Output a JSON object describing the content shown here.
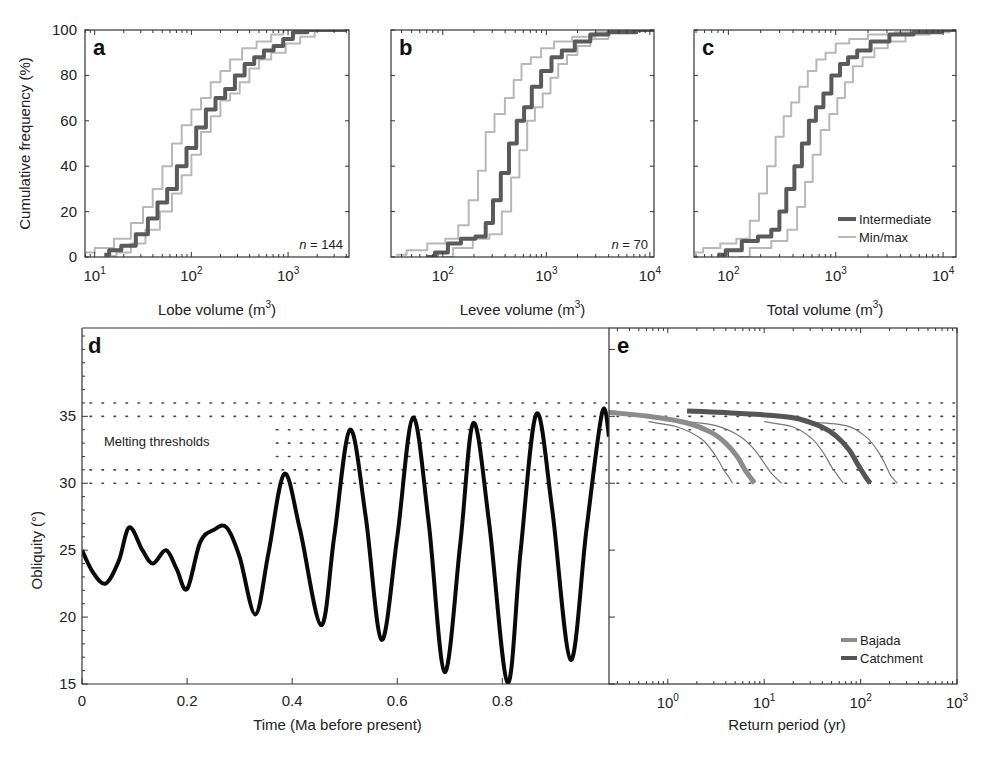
{
  "figure": {
    "panels": [
      "a",
      "b",
      "c",
      "d",
      "e"
    ]
  },
  "chart_data": [
    {
      "id": "a",
      "type": "line",
      "panel_label": "a",
      "xlabel": "Lobe volume (m3)",
      "xlabel_main": "Lobe volume (m",
      "xlabel_sup": "3",
      "xlabel_end": ")",
      "ylabel": "Cumulative frequency (%)",
      "xscale": "log",
      "xlim_log10": [
        0.9,
        3.63
      ],
      "ylim": [
        0,
        100
      ],
      "xticks": [
        {
          "base": "10",
          "exp": "1",
          "log": 1
        },
        {
          "base": "10",
          "exp": "2",
          "log": 2
        },
        {
          "base": "10",
          "exp": "3",
          "log": 3
        }
      ],
      "yticks": [
        "0",
        "20",
        "40",
        "60",
        "80",
        "100"
      ],
      "annotation_n": "n",
      "annotation_value": "= 144",
      "series": [
        {
          "name": "Intermediate",
          "role": "intermediate",
          "log10_x": [
            1.1,
            1.2,
            1.35,
            1.5,
            1.6,
            1.7,
            1.8,
            1.9,
            2.0,
            2.1,
            2.2,
            2.3,
            2.4,
            2.5,
            2.6,
            2.7,
            2.8,
            2.9,
            3.0,
            3.1,
            3.3,
            3.6
          ],
          "y": [
            1,
            3,
            5,
            10,
            17,
            24,
            30,
            40,
            48,
            57,
            65,
            70,
            74,
            80,
            85,
            88,
            91,
            93,
            96,
            99,
            100,
            100
          ]
        },
        {
          "name": "Min",
          "role": "minmax",
          "log10_x": [
            0.9,
            1.1,
            1.3,
            1.45,
            1.55,
            1.65,
            1.75,
            1.85,
            1.95,
            2.05,
            2.15,
            2.25,
            2.35,
            2.45,
            2.6,
            2.75,
            2.9,
            3.0,
            3.3,
            3.6
          ],
          "y": [
            2,
            4,
            8,
            15,
            22,
            30,
            40,
            50,
            58,
            65,
            70,
            77,
            82,
            87,
            92,
            95,
            98,
            100,
            100,
            100
          ]
        },
        {
          "name": "Max",
          "role": "minmax",
          "log10_x": [
            1.15,
            1.3,
            1.45,
            1.6,
            1.75,
            1.85,
            1.95,
            2.05,
            2.15,
            2.25,
            2.35,
            2.45,
            2.55,
            2.65,
            2.75,
            2.9,
            3.05,
            3.2,
            3.35,
            3.6
          ],
          "y": [
            0.5,
            2,
            6,
            12,
            20,
            28,
            36,
            45,
            55,
            62,
            69,
            72,
            77,
            83,
            87,
            90,
            94,
            97,
            100,
            100
          ]
        }
      ]
    },
    {
      "id": "b",
      "type": "line",
      "panel_label": "b",
      "xlabel": "Levee volume (m3)",
      "xlabel_main": "Levee volume (m",
      "xlabel_sup": "3",
      "xlabel_end": ")",
      "xscale": "log",
      "xlim_log10": [
        1.5,
        4.04
      ],
      "ylim": [
        0,
        100
      ],
      "xticks": [
        {
          "base": "10",
          "exp": "2",
          "log": 2
        },
        {
          "base": "10",
          "exp": "3",
          "log": 3
        },
        {
          "base": "10",
          "exp": "4",
          "log": 4
        }
      ],
      "annotation_n": "n",
      "annotation_value": "= 70",
      "series": [
        {
          "name": "Intermediate",
          "role": "intermediate",
          "log10_x": [
            1.85,
            2.0,
            2.1,
            2.25,
            2.38,
            2.45,
            2.52,
            2.6,
            2.68,
            2.75,
            2.82,
            2.9,
            3.0,
            3.1,
            3.2,
            3.35,
            3.5,
            3.7,
            4.04
          ],
          "y": [
            0,
            2,
            6,
            8,
            9,
            15,
            25,
            37,
            50,
            60,
            66,
            75,
            82,
            88,
            91,
            95,
            98,
            99,
            100
          ]
        },
        {
          "name": "Min",
          "role": "minmax",
          "log10_x": [
            1.55,
            1.75,
            1.95,
            2.1,
            2.2,
            2.3,
            2.38,
            2.45,
            2.55,
            2.65,
            2.72,
            2.8,
            2.9,
            3.0,
            3.15,
            3.35,
            3.6,
            4.04
          ],
          "y": [
            1,
            3,
            6,
            8,
            14,
            25,
            38,
            55,
            63,
            70,
            78,
            85,
            88,
            92,
            95,
            97,
            99,
            100
          ]
        },
        {
          "name": "Max",
          "role": "minmax",
          "log10_x": [
            2.0,
            2.2,
            2.38,
            2.52,
            2.62,
            2.7,
            2.78,
            2.85,
            2.93,
            3.0,
            3.08,
            3.15,
            3.25,
            3.35,
            3.5,
            3.7,
            4.04
          ],
          "y": [
            0,
            4,
            8,
            10,
            20,
            35,
            47,
            60,
            66,
            72,
            79,
            85,
            89,
            93,
            96,
            99,
            100
          ]
        }
      ]
    },
    {
      "id": "c",
      "type": "line",
      "panel_label": "c",
      "xlabel": "Total volume (m3)",
      "xlabel_main": "Total volume (m",
      "xlabel_sup": "3",
      "xlabel_end": ")",
      "xscale": "log",
      "xlim_log10": [
        1.68,
        4.12
      ],
      "ylim": [
        0,
        100
      ],
      "xticks": [
        {
          "base": "10",
          "exp": "2",
          "log": 2
        },
        {
          "base": "10",
          "exp": "3",
          "log": 3
        },
        {
          "base": "10",
          "exp": "4",
          "log": 4
        }
      ],
      "legend": [
        {
          "label": "Intermediate",
          "role": "intermediate"
        },
        {
          "label": "Min/max",
          "role": "minmax"
        }
      ],
      "series": [
        {
          "name": "Intermediate",
          "role": "intermediate",
          "log10_x": [
            1.9,
            2.05,
            2.2,
            2.35,
            2.45,
            2.5,
            2.58,
            2.65,
            2.72,
            2.78,
            2.85,
            2.92,
            3.0,
            3.08,
            3.15,
            3.25,
            3.4,
            3.6,
            3.85,
            4.12
          ],
          "y": [
            1,
            3,
            7,
            9,
            12,
            20,
            30,
            40,
            50,
            60,
            66,
            72,
            80,
            85,
            88,
            91,
            95,
            98,
            99,
            100
          ]
        },
        {
          "name": "Min",
          "role": "minmax",
          "log10_x": [
            1.68,
            1.85,
            2.0,
            2.15,
            2.25,
            2.32,
            2.4,
            2.48,
            2.55,
            2.62,
            2.7,
            2.78,
            2.86,
            2.95,
            3.05,
            3.2,
            3.4,
            3.7,
            4.12
          ],
          "y": [
            2,
            4,
            6,
            8,
            16,
            28,
            40,
            53,
            62,
            68,
            75,
            82,
            87,
            90,
            94,
            96,
            98,
            99,
            100
          ]
        },
        {
          "name": "Max",
          "role": "minmax",
          "log10_x": [
            2.1,
            2.3,
            2.5,
            2.6,
            2.68,
            2.75,
            2.82,
            2.9,
            2.98,
            3.05,
            3.12,
            3.2,
            3.3,
            3.42,
            3.55,
            3.75,
            4.0,
            4.12
          ],
          "y": [
            0,
            4,
            7,
            12,
            22,
            33,
            45,
            56,
            63,
            70,
            77,
            84,
            88,
            92,
            95,
            98,
            99,
            100
          ]
        }
      ]
    },
    {
      "id": "d",
      "type": "line",
      "panel_label": "d",
      "xlabel": "Time (Ma before present)",
      "ylabel": "Obliquity (°)",
      "xlim": [
        0,
        1.003
      ],
      "ylim": [
        15,
        41.6
      ],
      "xticks": [
        "0",
        "0.2",
        "0.4",
        "0.6",
        "0.8"
      ],
      "xtick_values": [
        0,
        0.2,
        0.4,
        0.6,
        0.8
      ],
      "yticks": [
        "15",
        "20",
        "25",
        "30",
        "35"
      ],
      "ytick_values": [
        15,
        20,
        25,
        30,
        35
      ],
      "melting_thresholds": [
        30,
        31,
        32,
        33,
        34,
        35,
        36
      ],
      "annotation": "Melting thresholds",
      "series": [
        {
          "name": "Obliquity",
          "x": [
            0.0,
            0.02,
            0.045,
            0.07,
            0.09,
            0.115,
            0.135,
            0.16,
            0.18,
            0.2,
            0.225,
            0.25,
            0.275,
            0.3,
            0.33,
            0.355,
            0.385,
            0.415,
            0.455,
            0.48,
            0.51,
            0.54,
            0.57,
            0.6,
            0.63,
            0.66,
            0.69,
            0.72,
            0.745,
            0.775,
            0.81,
            0.835,
            0.865,
            0.895,
            0.93,
            0.96,
            0.99,
            1.003
          ],
          "y": [
            25.0,
            23.4,
            22.5,
            24.2,
            26.7,
            25.0,
            24.0,
            25.0,
            23.6,
            22.1,
            25.6,
            26.5,
            26.7,
            24.5,
            20.2,
            24.8,
            30.7,
            26.5,
            19.4,
            26.0,
            34.0,
            27.5,
            18.3,
            26.0,
            34.9,
            27.0,
            15.9,
            25.5,
            34.5,
            27.0,
            15.1,
            25.0,
            35.2,
            28.0,
            16.8,
            26.5,
            35.3,
            33.5
          ]
        }
      ]
    },
    {
      "id": "e",
      "type": "line",
      "panel_label": "e",
      "xlabel": "Return period (yr)",
      "xscale": "log",
      "xlim_log10": [
        -0.61,
        3.0
      ],
      "ylim": [
        15,
        41.6
      ],
      "xticks": [
        {
          "base": "10",
          "exp": "0",
          "log": 0
        },
        {
          "base": "10",
          "exp": "1",
          "log": 1
        },
        {
          "base": "10",
          "exp": "2",
          "log": 2
        },
        {
          "base": "10",
          "exp": "3",
          "log": 3
        }
      ],
      "melting_thresholds": [
        30,
        31,
        32,
        33,
        34,
        35,
        36
      ],
      "legend": [
        {
          "label": "Bajada",
          "role": "bajada"
        },
        {
          "label": "Catchment",
          "role": "catchment"
        }
      ],
      "series": [
        {
          "name": "Bajada",
          "role": "bajada",
          "log10_x": [
            -0.61,
            -0.2,
            0.2,
            0.45,
            0.6,
            0.72,
            0.8,
            0.86,
            0.9
          ],
          "y": [
            35.3,
            35.0,
            34.5,
            33.8,
            33.0,
            32.0,
            31.0,
            30.4,
            30.0
          ]
        },
        {
          "name": "Bajada min",
          "role": "thin",
          "log10_x": [
            -0.2,
            0.1,
            0.35,
            0.5,
            0.58,
            0.63,
            0.67
          ],
          "y": [
            34.6,
            34.2,
            33.3,
            32.0,
            31.0,
            30.5,
            30.0
          ]
        },
        {
          "name": "Bajada max",
          "role": "thin",
          "log10_x": [
            0.2,
            0.5,
            0.75,
            0.9,
            1.0,
            1.08,
            1.18
          ],
          "y": [
            34.6,
            34.3,
            33.5,
            32.5,
            31.5,
            30.7,
            30.0
          ]
        },
        {
          "name": "Catchment",
          "role": "catchment",
          "log10_x": [
            0.2,
            0.8,
            1.3,
            1.6,
            1.75,
            1.88,
            1.98,
            2.05,
            2.1
          ],
          "y": [
            35.4,
            35.2,
            34.9,
            34.2,
            33.5,
            32.5,
            31.3,
            30.5,
            30.0
          ]
        },
        {
          "name": "Catchment min",
          "role": "thin",
          "log10_x": [
            1.0,
            1.3,
            1.5,
            1.62,
            1.7,
            1.77,
            1.82
          ],
          "y": [
            34.6,
            34.2,
            33.3,
            32.2,
            31.2,
            30.5,
            30.0
          ]
        },
        {
          "name": "Catchment max",
          "role": "thin",
          "log10_x": [
            1.45,
            1.85,
            2.05,
            2.17,
            2.25,
            2.31,
            2.38
          ],
          "y": [
            34.6,
            34.3,
            33.5,
            32.5,
            31.5,
            30.6,
            30.0
          ]
        }
      ]
    }
  ],
  "colors": {
    "intermediate": "#5a5a5a",
    "minmax": "#b8b8b8",
    "obliquity": "#0a0a0a",
    "bajada": "#8c8c8c",
    "catchment": "#555555",
    "thin": "#777777",
    "axis": "#333333",
    "dots": "#444444"
  }
}
